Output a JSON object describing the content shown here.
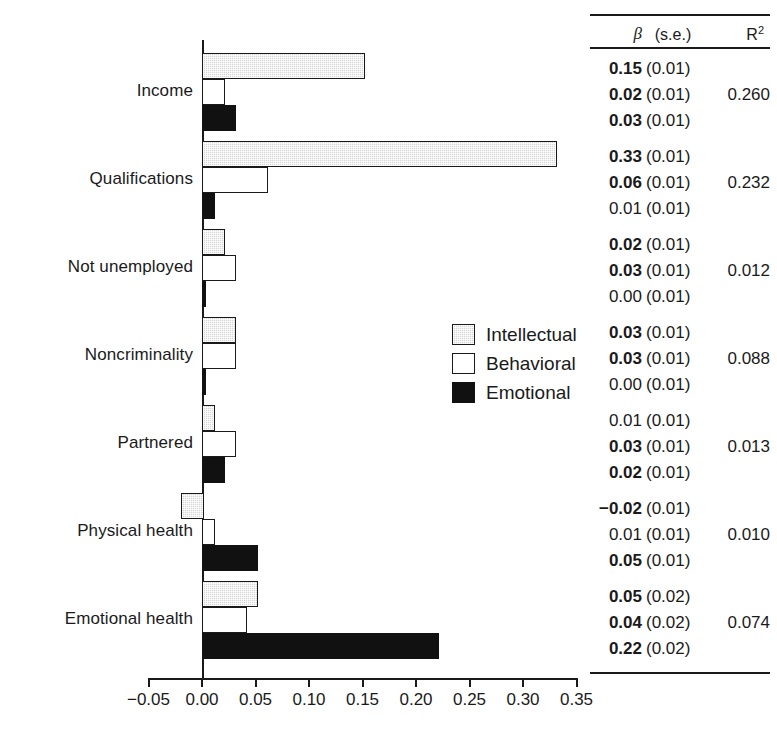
{
  "chart_data": {
    "type": "bar",
    "orientation": "horizontal",
    "title": "",
    "xlabel": "",
    "ylabel": "",
    "xlim": [
      -0.05,
      0.35
    ],
    "xticks": [
      "-0.05",
      "0.00",
      "0.05",
      "0.10",
      "0.15",
      "0.20",
      "0.25",
      "0.30",
      "0.35"
    ],
    "xtick_values": [
      -0.05,
      0.0,
      0.05,
      0.1,
      0.15,
      0.2,
      0.25,
      0.3,
      0.35
    ],
    "grid": false,
    "legend_position": "center-right",
    "categories": [
      "Income",
      "Qualifications",
      "Not unemployed",
      "Noncriminality",
      "Partnered",
      "Physical health",
      "Emotional health"
    ],
    "series": [
      {
        "name": "Intellectual",
        "color": "#d6d6d6",
        "values": [
          0.15,
          0.33,
          0.02,
          0.03,
          0.01,
          -0.02,
          0.05
        ]
      },
      {
        "name": "Behavioral",
        "color": "#ffffff",
        "values": [
          0.02,
          0.06,
          0.03,
          0.03,
          0.03,
          0.01,
          0.04
        ]
      },
      {
        "name": "Emotional",
        "color": "#111111",
        "values": [
          0.03,
          0.01,
          0.0,
          0.0,
          0.02,
          0.05,
          0.22
        ]
      }
    ]
  },
  "legend": {
    "items": [
      {
        "label": "Intellectual",
        "key": "intellectual"
      },
      {
        "label": "Behavioral",
        "key": "behavioral"
      },
      {
        "label": "Emotional",
        "key": "emotional"
      }
    ]
  },
  "stats_table": {
    "header": {
      "beta": "β",
      "se": "(s.e.)",
      "r2": "R",
      "r2_sup": "2"
    },
    "groups": [
      {
        "category": "Income",
        "r2": "0.260",
        "rows": [
          {
            "beta": "0.15",
            "se": "(0.01)",
            "bold": true
          },
          {
            "beta": "0.02",
            "se": "(0.01)",
            "bold": true
          },
          {
            "beta": "0.03",
            "se": "(0.01)",
            "bold": true
          }
        ]
      },
      {
        "category": "Qualifications",
        "r2": "0.232",
        "rows": [
          {
            "beta": "0.33",
            "se": "(0.01)",
            "bold": true
          },
          {
            "beta": "0.06",
            "se": "(0.01)",
            "bold": true
          },
          {
            "beta": "0.01",
            "se": "(0.01)",
            "bold": false
          }
        ]
      },
      {
        "category": "Not unemployed",
        "r2": "0.012",
        "rows": [
          {
            "beta": "0.02",
            "se": "(0.01)",
            "bold": true
          },
          {
            "beta": "0.03",
            "se": "(0.01)",
            "bold": true
          },
          {
            "beta": "0.00",
            "se": "(0.01)",
            "bold": false
          }
        ]
      },
      {
        "category": "Noncriminality",
        "r2": "0.088",
        "rows": [
          {
            "beta": "0.03",
            "se": "(0.01)",
            "bold": true
          },
          {
            "beta": "0.03",
            "se": "(0.01)",
            "bold": true
          },
          {
            "beta": "0.00",
            "se": "(0.01)",
            "bold": false
          }
        ]
      },
      {
        "category": "Partnered",
        "r2": "0.013",
        "rows": [
          {
            "beta": "0.01",
            "se": "(0.01)",
            "bold": false
          },
          {
            "beta": "0.03",
            "se": "(0.01)",
            "bold": true
          },
          {
            "beta": "0.02",
            "se": "(0.01)",
            "bold": true
          }
        ]
      },
      {
        "category": "Physical health",
        "r2": "0.010",
        "rows": [
          {
            "beta": "−0.02",
            "se": "(0.01)",
            "bold": true
          },
          {
            "beta": "0.01",
            "se": "(0.01)",
            "bold": false
          },
          {
            "beta": "0.05",
            "se": "(0.01)",
            "bold": true
          }
        ]
      },
      {
        "category": "Emotional health",
        "r2": "0.074",
        "rows": [
          {
            "beta": "0.05",
            "se": "(0.02)",
            "bold": true
          },
          {
            "beta": "0.04",
            "se": "(0.02)",
            "bold": true
          },
          {
            "beta": "0.22",
            "se": "(0.02)",
            "bold": true
          }
        ]
      }
    ]
  }
}
